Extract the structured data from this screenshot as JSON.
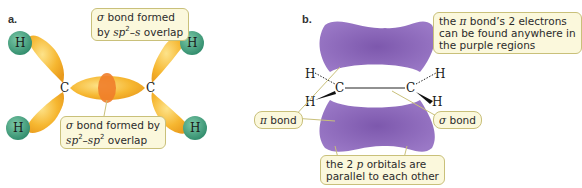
{
  "panel_a": {
    "label": "a.",
    "callout_top": {
      "line1_prefix": "σ",
      "line1": " bond formed",
      "line2_prefix": "by ",
      "line2_italic": "sp",
      "line2_sup": "2",
      "line2_rest": "–",
      "line2_italic2": "s",
      "line2_end": " overlap"
    },
    "callout_bottom": {
      "line1_prefix": "σ",
      "line1": " bond formed by",
      "line2_italic": "sp",
      "line2_sup": "2",
      "line2_dash": "–",
      "line2_italic2": "sp",
      "line2_sup2": "2",
      "line2_end": " overlap"
    },
    "atoms": {
      "c_left": "C",
      "c_right": "C",
      "h1": "H",
      "h2": "H",
      "h3": "H",
      "h4": "H"
    },
    "colors": {
      "lobe": "#f5b52a",
      "overlap": "#ef7d2a",
      "hydrogen": "#3a9a78"
    }
  },
  "panel_b": {
    "label": "b.",
    "callout_top_right": {
      "line1_a": "the ",
      "line1_pi": "π",
      "line1_b": " bond’s 2 electrons",
      "line2": "can be found anywhere in",
      "line3": "the purple regions"
    },
    "callout_pi_bond": {
      "pi": "π",
      "text": " bond"
    },
    "callout_sigma_bond": {
      "sigma": "σ",
      "text": " bond"
    },
    "callout_bottom": {
      "line1_a": "the 2 ",
      "line1_p": "p",
      "line1_b": " orbitals are",
      "line2": "parallel to each other"
    },
    "atoms": {
      "c_left": "C",
      "c_right": "C",
      "h_tl": "H",
      "h_bl": "H",
      "h_tr": "H",
      "h_br": "H"
    },
    "colors": {
      "orbital": "#8a66b8"
    }
  }
}
